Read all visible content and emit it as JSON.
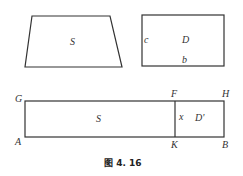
{
  "figure": {
    "caption": "图 4. 16",
    "top_left_shape": {
      "type": "trapezoid",
      "label": "S"
    },
    "top_right_shape": {
      "type": "rectangle",
      "label": "D",
      "side_labels": {
        "left": "c",
        "bottom": "b"
      }
    },
    "bottom_shape": {
      "type": "rectangle",
      "vertices": {
        "top_left": "G",
        "bottom_left": "A",
        "top_divider": "F",
        "bottom_divider": "K",
        "top_right": "H",
        "bottom_right": "B"
      },
      "left_region_label": "S",
      "divider_label": "x",
      "right_region_label": "D'"
    },
    "colors": {
      "stroke": "#333333",
      "background": "#ffffff"
    }
  }
}
